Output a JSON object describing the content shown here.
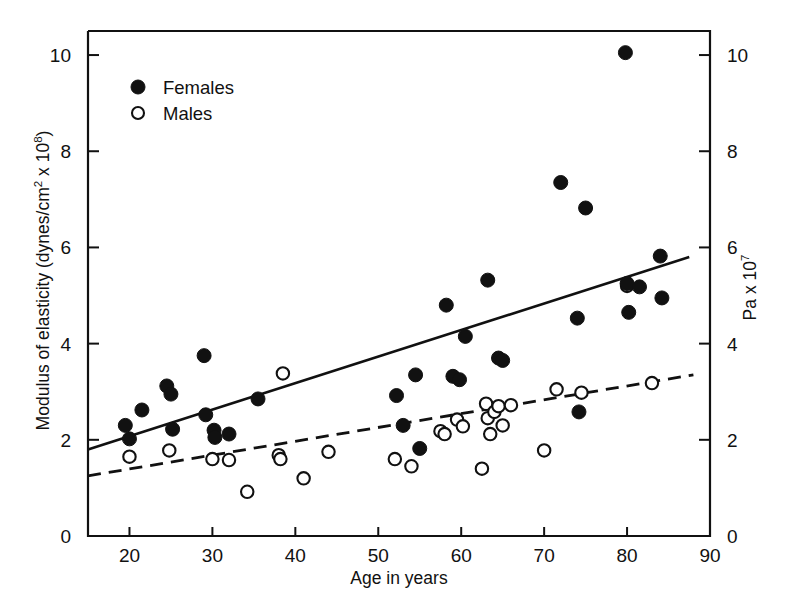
{
  "chart_data": {
    "type": "scatter",
    "title": "",
    "xlabel": "Age in years",
    "ylabel": "Modulus of elasticity (dynes/cm2 x 108)",
    "ylabel_parts": {
      "text": "Modulus of elasticity (dynes/cm",
      "sup1": "2",
      "mid": " x 10",
      "sup2": "8",
      "tail": ")"
    },
    "y2label": "Pa x 107",
    "y2label_parts": {
      "text": "Pa x 10",
      "sup": "7"
    },
    "xlim": [
      15,
      90
    ],
    "ylim": [
      0,
      10.5
    ],
    "y2lim": [
      0,
      10.5
    ],
    "xticks": [
      20,
      30,
      40,
      50,
      60,
      70,
      80,
      90
    ],
    "yticks": [
      0,
      2,
      4,
      6,
      8,
      10
    ],
    "y2ticks": [
      0,
      2,
      4,
      6,
      8,
      10
    ],
    "grid": false,
    "legend_position": "top-left",
    "legend": [
      {
        "label": "Females",
        "marker": "filled-circle"
      },
      {
        "label": "Males",
        "marker": "open-circle"
      }
    ],
    "series": [
      {
        "name": "Females",
        "marker": "filled-circle",
        "points": [
          [
            19.5,
            2.3
          ],
          [
            20.0,
            2.02
          ],
          [
            21.5,
            2.62
          ],
          [
            24.5,
            3.12
          ],
          [
            25.0,
            2.95
          ],
          [
            25.2,
            2.22
          ],
          [
            29.0,
            3.75
          ],
          [
            29.2,
            2.52
          ],
          [
            30.2,
            2.2
          ],
          [
            30.3,
            2.05
          ],
          [
            32.0,
            2.12
          ],
          [
            35.5,
            2.85
          ],
          [
            52.2,
            2.92
          ],
          [
            53.0,
            2.3
          ],
          [
            54.5,
            3.35
          ],
          [
            55.0,
            1.82
          ],
          [
            58.2,
            4.8
          ],
          [
            59.0,
            3.32
          ],
          [
            59.8,
            3.25
          ],
          [
            60.5,
            4.15
          ],
          [
            63.2,
            5.32
          ],
          [
            64.5,
            3.7
          ],
          [
            65.0,
            3.65
          ],
          [
            72.0,
            7.35
          ],
          [
            74.0,
            4.53
          ],
          [
            74.2,
            2.58
          ],
          [
            75.0,
            6.82
          ],
          [
            79.8,
            10.05
          ],
          [
            80.0,
            5.25
          ],
          [
            80.2,
            4.65
          ],
          [
            81.5,
            5.18
          ],
          [
            84.0,
            5.82
          ],
          [
            84.2,
            4.95
          ]
        ]
      },
      {
        "name": "Males",
        "marker": "open-circle",
        "points": [
          [
            20.0,
            1.65
          ],
          [
            24.8,
            1.78
          ],
          [
            30.0,
            1.6
          ],
          [
            32.0,
            1.58
          ],
          [
            34.2,
            0.92
          ],
          [
            38.0,
            1.68
          ],
          [
            38.2,
            1.6
          ],
          [
            38.5,
            3.38
          ],
          [
            41.0,
            1.2
          ],
          [
            44.0,
            1.75
          ],
          [
            52.0,
            1.6
          ],
          [
            54.0,
            1.45
          ],
          [
            57.5,
            2.18
          ],
          [
            58.0,
            2.12
          ],
          [
            59.5,
            2.42
          ],
          [
            60.2,
            2.28
          ],
          [
            62.5,
            1.4
          ],
          [
            63.0,
            2.75
          ],
          [
            63.2,
            2.45
          ],
          [
            63.5,
            2.12
          ],
          [
            64.0,
            2.58
          ],
          [
            64.5,
            2.7
          ],
          [
            65.0,
            2.3
          ],
          [
            66.0,
            2.72
          ],
          [
            70.0,
            1.78
          ],
          [
            71.5,
            3.05
          ],
          [
            74.5,
            2.98
          ],
          [
            80.0,
            5.2
          ],
          [
            83.0,
            3.18
          ]
        ]
      }
    ],
    "trend_lines": [
      {
        "name": "Females fit",
        "style": "solid",
        "x": [
          15,
          87.5
        ],
        "y": [
          1.8,
          5.8
        ]
      },
      {
        "name": "Males fit",
        "style": "dashed",
        "x": [
          15,
          88
        ],
        "y": [
          1.25,
          3.35
        ]
      }
    ]
  },
  "legend_block": {
    "females": "Females",
    "males": "Males"
  },
  "axes": {
    "x_title": "Age in years",
    "x_ticks": [
      "20",
      "30",
      "40",
      "50",
      "60",
      "70",
      "80",
      "90"
    ],
    "y_ticks": [
      "0",
      "2",
      "4",
      "6",
      "8",
      "10"
    ],
    "y2_ticks": [
      "0",
      "2",
      "4",
      "6",
      "8",
      "10"
    ]
  },
  "colors": {
    "ink": "#111111",
    "paper": "#ffffff"
  }
}
